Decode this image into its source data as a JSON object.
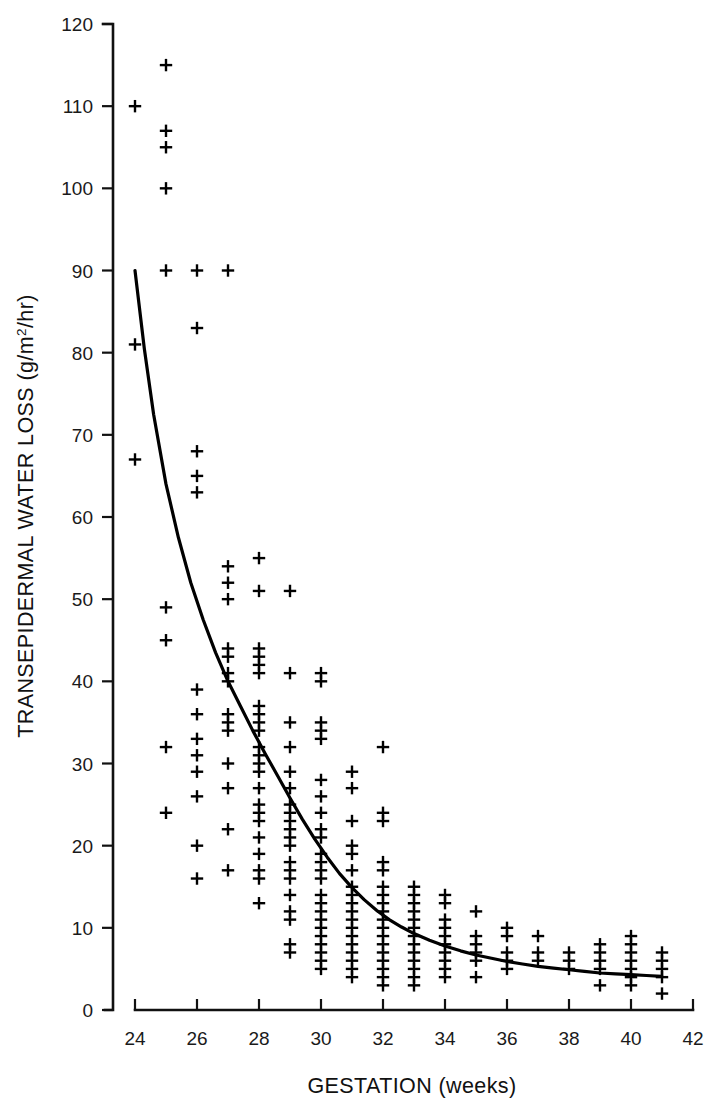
{
  "figure": {
    "background": "#ffffff",
    "ink_color": "#000000",
    "marker_glyph": "plus-sign"
  },
  "chart_data": {
    "type": "scatter",
    "title": "",
    "subtitle": "",
    "xlabel": "GESTATION (weeks)",
    "ylabel_text": "TRANSEPIDERMAL WATER LOSS (g/m",
    "ylabel_superscript": "2",
    "ylabel_tail": "/hr)",
    "ylabel_full": "TRANSEPIDERMAL WATER LOSS (g/m2/hr)",
    "xlim": [
      24,
      42
    ],
    "ylim": [
      0,
      120
    ],
    "xticks": [
      24,
      26,
      28,
      30,
      32,
      34,
      36,
      38,
      40,
      42
    ],
    "yticks": [
      0,
      10,
      20,
      30,
      40,
      50,
      60,
      70,
      80,
      90,
      100,
      110,
      120
    ],
    "xtick_labels": [
      "24",
      "26",
      "28",
      "30",
      "32",
      "34",
      "36",
      "38",
      "40",
      "42"
    ],
    "ytick_labels": [
      "0",
      "10",
      "20",
      "30",
      "40",
      "50",
      "60",
      "70",
      "80",
      "90",
      "100",
      "110",
      "120"
    ],
    "grid": false,
    "legend": null,
    "legend_position": "none",
    "marker_style": "plus",
    "series": [
      {
        "name": "Transepidermal water loss measurements",
        "marker": "plus",
        "points": [
          [
            24,
            110
          ],
          [
            24,
            81
          ],
          [
            24,
            67
          ],
          [
            25,
            115
          ],
          [
            25,
            107
          ],
          [
            25,
            105
          ],
          [
            25,
            100
          ],
          [
            25,
            90
          ],
          [
            25,
            49
          ],
          [
            25,
            45
          ],
          [
            25,
            32
          ],
          [
            25,
            24
          ],
          [
            26,
            90
          ],
          [
            26,
            83
          ],
          [
            26,
            68
          ],
          [
            26,
            65
          ],
          [
            26,
            63
          ],
          [
            26,
            39
          ],
          [
            26,
            36
          ],
          [
            26,
            33
          ],
          [
            26,
            31
          ],
          [
            26,
            29
          ],
          [
            26,
            26
          ],
          [
            26,
            20
          ],
          [
            26,
            16
          ],
          [
            27,
            90
          ],
          [
            27,
            54
          ],
          [
            27,
            52
          ],
          [
            27,
            50
          ],
          [
            27,
            44
          ],
          [
            27,
            43
          ],
          [
            27,
            41
          ],
          [
            27,
            40
          ],
          [
            27,
            36
          ],
          [
            27,
            35
          ],
          [
            27,
            34
          ],
          [
            27,
            30
          ],
          [
            27,
            27
          ],
          [
            27,
            22
          ],
          [
            27,
            17
          ],
          [
            28,
            55
          ],
          [
            28,
            51
          ],
          [
            28,
            44
          ],
          [
            28,
            43
          ],
          [
            28,
            42
          ],
          [
            28,
            41
          ],
          [
            28,
            37
          ],
          [
            28,
            36
          ],
          [
            28,
            35
          ],
          [
            28,
            34
          ],
          [
            28,
            32
          ],
          [
            28,
            31
          ],
          [
            28,
            30
          ],
          [
            28,
            29
          ],
          [
            28,
            27
          ],
          [
            28,
            25
          ],
          [
            28,
            24
          ],
          [
            28,
            23
          ],
          [
            28,
            21
          ],
          [
            28,
            19
          ],
          [
            28,
            17
          ],
          [
            28,
            16
          ],
          [
            28,
            13
          ],
          [
            29,
            51
          ],
          [
            29,
            41
          ],
          [
            29,
            35
          ],
          [
            29,
            32
          ],
          [
            29,
            29
          ],
          [
            29,
            27
          ],
          [
            29,
            25
          ],
          [
            29,
            24
          ],
          [
            29,
            23
          ],
          [
            29,
            22
          ],
          [
            29,
            21
          ],
          [
            29,
            20
          ],
          [
            29,
            18
          ],
          [
            29,
            17
          ],
          [
            29,
            16
          ],
          [
            29,
            14
          ],
          [
            29,
            12
          ],
          [
            29,
            11
          ],
          [
            29,
            8
          ],
          [
            29,
            7
          ],
          [
            30,
            41
          ],
          [
            30,
            40
          ],
          [
            30,
            35
          ],
          [
            30,
            34
          ],
          [
            30,
            33
          ],
          [
            30,
            28
          ],
          [
            30,
            26
          ],
          [
            30,
            24
          ],
          [
            30,
            22
          ],
          [
            30,
            21
          ],
          [
            30,
            19
          ],
          [
            30,
            18
          ],
          [
            30,
            17
          ],
          [
            30,
            16
          ],
          [
            30,
            14
          ],
          [
            30,
            13
          ],
          [
            30,
            12
          ],
          [
            30,
            11
          ],
          [
            30,
            10
          ],
          [
            30,
            9
          ],
          [
            30,
            8
          ],
          [
            30,
            7
          ],
          [
            30,
            6
          ],
          [
            30,
            5
          ],
          [
            31,
            29
          ],
          [
            31,
            27
          ],
          [
            31,
            23
          ],
          [
            31,
            20
          ],
          [
            31,
            19
          ],
          [
            31,
            17
          ],
          [
            31,
            15
          ],
          [
            31,
            14
          ],
          [
            31,
            13
          ],
          [
            31,
            12
          ],
          [
            31,
            11
          ],
          [
            31,
            10
          ],
          [
            31,
            9
          ],
          [
            31,
            8
          ],
          [
            31,
            7
          ],
          [
            31,
            6
          ],
          [
            31,
            5
          ],
          [
            31,
            4
          ],
          [
            32,
            32
          ],
          [
            32,
            24
          ],
          [
            32,
            23
          ],
          [
            32,
            18
          ],
          [
            32,
            17
          ],
          [
            32,
            15
          ],
          [
            32,
            14
          ],
          [
            32,
            13
          ],
          [
            32,
            12
          ],
          [
            32,
            11
          ],
          [
            32,
            10
          ],
          [
            32,
            9
          ],
          [
            32,
            8
          ],
          [
            32,
            7
          ],
          [
            32,
            6
          ],
          [
            32,
            5
          ],
          [
            32,
            4
          ],
          [
            32,
            3
          ],
          [
            33,
            15
          ],
          [
            33,
            14
          ],
          [
            33,
            13
          ],
          [
            33,
            12
          ],
          [
            33,
            11
          ],
          [
            33,
            10
          ],
          [
            33,
            9
          ],
          [
            33,
            8
          ],
          [
            33,
            7
          ],
          [
            33,
            6
          ],
          [
            33,
            5
          ],
          [
            33,
            4
          ],
          [
            33,
            3
          ],
          [
            34,
            14
          ],
          [
            34,
            13
          ],
          [
            34,
            11
          ],
          [
            34,
            10
          ],
          [
            34,
            9
          ],
          [
            34,
            8
          ],
          [
            34,
            7
          ],
          [
            34,
            6
          ],
          [
            34,
            5
          ],
          [
            34,
            4
          ],
          [
            35,
            12
          ],
          [
            35,
            9
          ],
          [
            35,
            8
          ],
          [
            35,
            7
          ],
          [
            35,
            6
          ],
          [
            35,
            4
          ],
          [
            36,
            10
          ],
          [
            36,
            9
          ],
          [
            36,
            7
          ],
          [
            36,
            6
          ],
          [
            36,
            5
          ],
          [
            37,
            9
          ],
          [
            37,
            7
          ],
          [
            37,
            6
          ],
          [
            38,
            7
          ],
          [
            38,
            6
          ],
          [
            38,
            5
          ],
          [
            39,
            8
          ],
          [
            39,
            7
          ],
          [
            39,
            6
          ],
          [
            39,
            5
          ],
          [
            39,
            3
          ],
          [
            40,
            9
          ],
          [
            40,
            8
          ],
          [
            40,
            7
          ],
          [
            40,
            6
          ],
          [
            40,
            5
          ],
          [
            40,
            4
          ],
          [
            40,
            3
          ],
          [
            41,
            7
          ],
          [
            41,
            6
          ],
          [
            41,
            5
          ],
          [
            41,
            4
          ],
          [
            41,
            2
          ]
        ]
      }
    ],
    "fit_curve": {
      "name": "exponential decay fit",
      "style": "solid",
      "points": [
        [
          24.0,
          90.0
        ],
        [
          24.3,
          80.5
        ],
        [
          24.6,
          72.5
        ],
        [
          25.0,
          64.0
        ],
        [
          25.4,
          57.5
        ],
        [
          25.8,
          52.0
        ],
        [
          26.2,
          47.5
        ],
        [
          26.6,
          43.5
        ],
        [
          27.0,
          40.0
        ],
        [
          27.4,
          37.0
        ],
        [
          27.8,
          34.0
        ],
        [
          28.2,
          31.2
        ],
        [
          28.6,
          28.5
        ],
        [
          29.0,
          25.8
        ],
        [
          29.4,
          23.2
        ],
        [
          29.8,
          20.8
        ],
        [
          30.2,
          18.6
        ],
        [
          30.6,
          16.6
        ],
        [
          31.0,
          14.9
        ],
        [
          31.4,
          13.4
        ],
        [
          31.8,
          12.1
        ],
        [
          32.2,
          11.0
        ],
        [
          32.6,
          10.1
        ],
        [
          33.0,
          9.3
        ],
        [
          33.5,
          8.5
        ],
        [
          34.0,
          7.8
        ],
        [
          34.5,
          7.2
        ],
        [
          35.0,
          6.7
        ],
        [
          35.5,
          6.3
        ],
        [
          36.0,
          5.9
        ],
        [
          36.5,
          5.6
        ],
        [
          37.0,
          5.3
        ],
        [
          37.5,
          5.1
        ],
        [
          38.0,
          4.9
        ],
        [
          38.5,
          4.7
        ],
        [
          39.0,
          4.5
        ],
        [
          39.5,
          4.4
        ],
        [
          40.0,
          4.3
        ],
        [
          40.5,
          4.2
        ],
        [
          41.0,
          4.1
        ]
      ]
    }
  }
}
